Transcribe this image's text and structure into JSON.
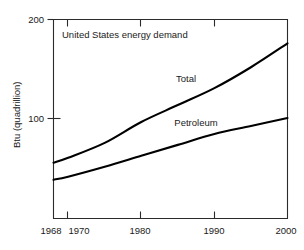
{
  "chart_data": {
    "type": "line",
    "title": "United States energy demand",
    "xlabel": "",
    "ylabel": "Btu (quadrillion)",
    "xlim": [
      1968,
      2000
    ],
    "ylim": [
      0,
      200
    ],
    "grid": false,
    "legend_position": "inline-annotations",
    "xticks": [
      1968,
      1970,
      1980,
      1990,
      2000
    ],
    "xticklabels": [
      "1968",
      "1970",
      "1980",
      "1990",
      "2000"
    ],
    "yticks": [
      100,
      200
    ],
    "yticklabels": [
      "100",
      "200"
    ],
    "x": [
      1968,
      1970,
      1975,
      1980,
      1985,
      1990,
      1995,
      2000
    ],
    "series": [
      {
        "name": "Total",
        "label": "Total",
        "color": "#000000",
        "values": [
          56,
          61,
          76,
          97,
          114,
          131,
          152,
          176
        ]
      },
      {
        "name": "Petroleum",
        "label": "Petroleum",
        "color": "#000000",
        "values": [
          39,
          42,
          52,
          63,
          74,
          85,
          93,
          101
        ]
      }
    ],
    "annotations": [
      {
        "text": "United States energy demand",
        "x": 1972,
        "y": 184
      },
      {
        "text": "Total",
        "x": 1986,
        "y": 145
      },
      {
        "text": "Petroleum",
        "x": 1987,
        "y": 98
      }
    ]
  },
  "axes": {
    "y_axis_title": "Btu (quadrillion)",
    "y_tick_top": "200",
    "y_tick_mid": "100",
    "x_tick_1968": "1968",
    "x_tick_1970": "1970",
    "x_tick_1980": "1980",
    "x_tick_1990": "1990",
    "x_tick_2000": "2000"
  },
  "labels": {
    "chart_note": "United States energy demand",
    "series_total": "Total",
    "series_petroleum": "Petroleum"
  }
}
